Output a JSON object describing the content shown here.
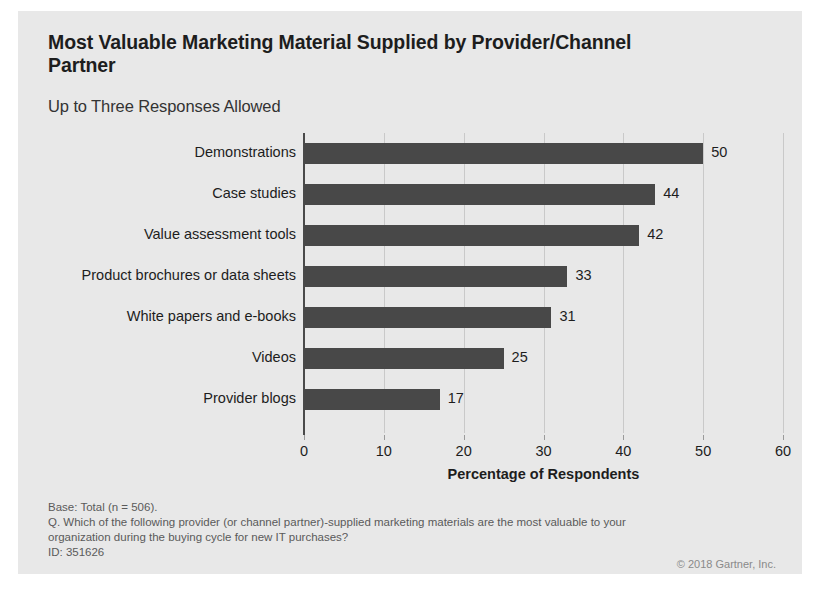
{
  "panel": {
    "background_color": "#e8e8e8"
  },
  "header": {
    "title": "Most Valuable Marketing Material Supplied by Provider/Channel Partner",
    "subtitle": "Up to Three Responses Allowed"
  },
  "footnotes": {
    "base": "Base: Total (n = 506).",
    "question": "Q. Which of the following provider (or channel partner)-supplied marketing materials are the most valuable to your organization during the buying cycle for new IT purchases?",
    "id": "ID: 351626",
    "copyright": "© 2018 Gartner, Inc."
  },
  "chart_data": {
    "type": "bar",
    "orientation": "horizontal",
    "title": "Most Valuable Marketing Material Supplied by Provider/Channel Partner",
    "subtitle": "Up to Three Responses Allowed",
    "categories": [
      "Demonstrations",
      "Case studies",
      "Value assessment tools",
      "Product brochures or data sheets",
      "White papers and e-books",
      "Videos",
      "Provider blogs"
    ],
    "values": [
      50,
      44,
      42,
      33,
      31,
      25,
      17
    ],
    "value_labels": [
      "50",
      "44",
      "42",
      "33",
      "31",
      "25",
      "17"
    ],
    "xlabel": "Percentage of Respondents",
    "ylabel": "",
    "xlim": [
      0,
      60
    ],
    "xticks": [
      0,
      10,
      20,
      30,
      40,
      50,
      60
    ],
    "xtick_labels": [
      "0",
      "10",
      "20",
      "30",
      "40",
      "50",
      "60"
    ],
    "grid": true,
    "grid_axis": "x",
    "legend": false,
    "bar_color": "#484848",
    "gridline_color": "#c9c9c9",
    "axis_color": "#4a4a4a"
  }
}
